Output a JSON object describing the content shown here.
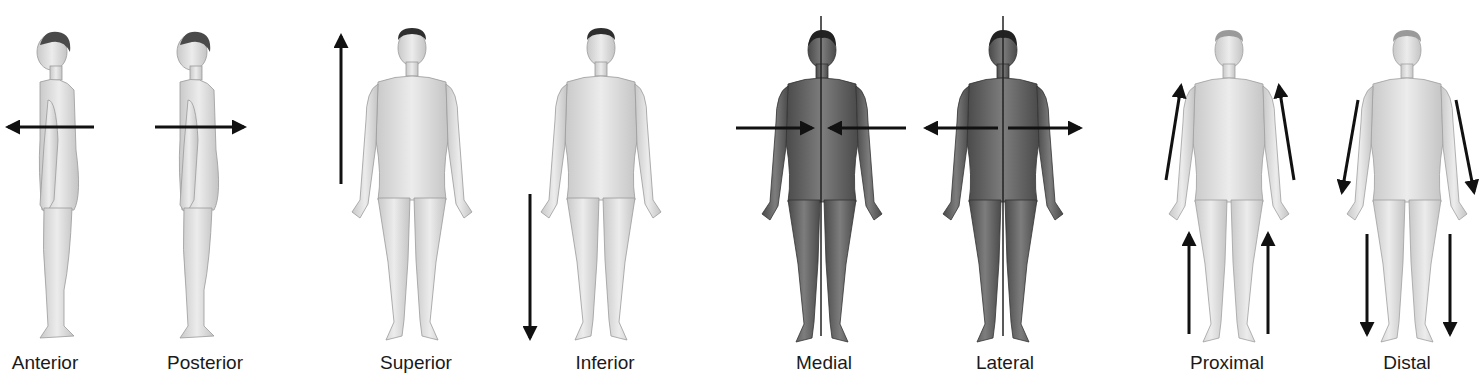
{
  "figure": {
    "background": "#ffffff",
    "arrow_color": "#111111",
    "skin_light": "#dcdcdc",
    "skin_dark": "#6e6e6e",
    "hair": "#3a3a3a"
  },
  "panels": [
    {
      "id": "anterior",
      "label": "Anterior",
      "view": "side-facing-left",
      "arrow": "horizontal-left",
      "label_x": 45
    },
    {
      "id": "posterior",
      "label": "Posterior",
      "view": "side-facing-left",
      "arrow": "horizontal-right",
      "label_x": 205
    },
    {
      "id": "superior",
      "label": "Superior",
      "view": "front-male",
      "arrow": "vertical-up",
      "label_x": 416
    },
    {
      "id": "inferior",
      "label": "Inferior",
      "view": "front-male",
      "arrow": "vertical-down",
      "label_x": 605
    },
    {
      "id": "medial",
      "label": "Medial",
      "view": "front-female-dark-midline",
      "arrow": "converging-to-midline",
      "label_x": 824
    },
    {
      "id": "lateral",
      "label": "Lateral",
      "view": "front-female-dark-midline",
      "arrow": "diverging-from-midline",
      "label_x": 1005
    },
    {
      "id": "proximal",
      "label": "Proximal",
      "view": "front-female",
      "arrow": "limbs-up-toward-trunk",
      "label_x": 1227
    },
    {
      "id": "distal",
      "label": "Distal",
      "view": "front-female",
      "arrow": "limbs-down-away-from-trunk",
      "label_x": 1407
    }
  ]
}
